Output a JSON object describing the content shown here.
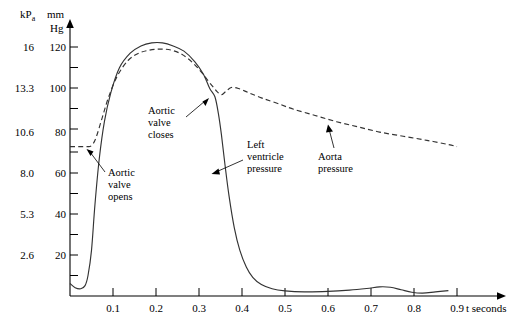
{
  "chart_data": {
    "type": "line",
    "title": "",
    "xlabel": "t seconds",
    "ylabel_primary": "kPa",
    "ylabel_secondary": "mm Hg",
    "xlim": [
      0,
      0.95
    ],
    "ylim": [
      0,
      130
    ],
    "grid": false,
    "legend": "none",
    "xticks": [
      0.1,
      0.2,
      0.3,
      0.4,
      0.5,
      0.6,
      0.7,
      0.8,
      0.9
    ],
    "xtick_labels": [
      "0.1",
      "0.2",
      "0.3",
      "0.4",
      "0.5",
      "0.6",
      "0.7",
      "0.8",
      "0.9"
    ],
    "yticks_mmhg": [
      20,
      40,
      60,
      80,
      100,
      120
    ],
    "ytick_labels_mmhg": [
      "20",
      "40",
      "60",
      "80",
      "100",
      "120"
    ],
    "ytick_labels_kpa": [
      "2.6",
      "5.3",
      "8.0",
      "10.6",
      "13.3",
      "16"
    ],
    "series": [
      {
        "name": "Left ventricle pressure",
        "style": "solid",
        "x": [
          0.0,
          0.012,
          0.025,
          0.035,
          0.042,
          0.05,
          0.058,
          0.068,
          0.08,
          0.095,
          0.115,
          0.14,
          0.165,
          0.19,
          0.215,
          0.24,
          0.265,
          0.29,
          0.31,
          0.325,
          0.337,
          0.345,
          0.352,
          0.36,
          0.37,
          0.382,
          0.395,
          0.41,
          0.425,
          0.445,
          0.47,
          0.5,
          0.545,
          0.6,
          0.65,
          0.69,
          0.72,
          0.745,
          0.77,
          0.795,
          0.82,
          0.85,
          0.88
        ],
        "y": [
          6,
          4,
          3.5,
          5,
          10,
          22,
          44,
          66,
          84,
          98,
          110,
          117,
          120.5,
          122,
          122,
          120.5,
          118,
          113,
          107,
          100,
          96,
          88,
          78,
          64,
          48,
          33,
          22,
          14,
          9,
          5.5,
          3.5,
          2.5,
          2,
          2.2,
          2.8,
          3.6,
          4.4,
          4.2,
          3.0,
          1.8,
          1.4,
          2.0,
          2.6
        ]
      },
      {
        "name": "Aorta pressure",
        "style": "dashed",
        "x": [
          0.0,
          0.02,
          0.04,
          0.05,
          0.06,
          0.075,
          0.09,
          0.11,
          0.135,
          0.16,
          0.185,
          0.21,
          0.235,
          0.26,
          0.285,
          0.305,
          0.322,
          0.334,
          0.342,
          0.352,
          0.362,
          0.375,
          0.392,
          0.415,
          0.445,
          0.48,
          0.52,
          0.57,
          0.62,
          0.67,
          0.72,
          0.775,
          0.83,
          0.88,
          0.9
        ],
        "y": [
          72,
          72,
          72,
          72.5,
          76,
          86,
          96,
          106,
          113.5,
          117,
          118.5,
          119,
          118.5,
          116.5,
          112.5,
          108,
          103.5,
          100.5,
          98.5,
          97,
          98.5,
          100.5,
          100,
          98,
          95.5,
          93,
          90,
          87,
          84,
          81.5,
          79,
          77,
          75,
          73,
          72
        ]
      }
    ],
    "annotations": [
      {
        "name": "aortic-valve-opens",
        "text": [
          "Aortic",
          "valve",
          "opens"
        ],
        "target_t": 0.055,
        "target_p": 72
      },
      {
        "name": "aortic-valve-closes",
        "text": [
          "Aortic",
          "valve",
          "closes"
        ],
        "target_t": 0.337,
        "target_p": 99
      },
      {
        "name": "left-ventricle-pressure",
        "text": [
          "Left",
          "ventricle",
          "pressure"
        ],
        "target_t": 0.345,
        "target_p": 62
      },
      {
        "name": "aorta-pressure",
        "text": [
          "Aorta",
          "pressure"
        ],
        "target_t": 0.6,
        "target_p": 86
      }
    ]
  },
  "axes": {
    "x_axis_label": "t seconds",
    "y_unit_kpa": "kPa",
    "y_unit_kpa_base": "kP",
    "y_unit_kpa_sub": "a",
    "y_unit_mm": "mm",
    "y_unit_hg": "Hg"
  },
  "annotation_text": {
    "aortic_valve_opens_1": "Aortic",
    "aortic_valve_opens_2": "valve",
    "aortic_valve_opens_3": "opens",
    "aortic_valve_closes_1": "Aortic",
    "aortic_valve_closes_2": "valve",
    "aortic_valve_closes_3": "closes",
    "left_ventricle_1": "Left",
    "left_ventricle_2": "ventricle",
    "left_ventricle_3": "pressure",
    "aorta_pressure_1": "Aorta",
    "aorta_pressure_2": "pressure"
  },
  "ticks": {
    "kpa": [
      "16",
      "13.3",
      "10.6",
      "8.0",
      "5.3",
      "2.6"
    ],
    "mmhg": [
      "120",
      "100",
      "80",
      "60",
      "40",
      "20"
    ],
    "x": [
      "0.1",
      "0.2",
      "0.3",
      "0.4",
      "0.5",
      "0.6",
      "0.7",
      "0.8",
      "0.9"
    ]
  },
  "colors": {
    "curve": "#333333",
    "axis": "#000000",
    "background": "#ffffff"
  }
}
